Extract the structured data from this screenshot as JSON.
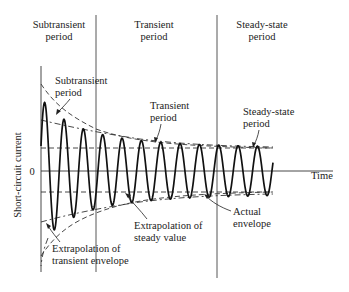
{
  "figure": {
    "type": "short-circuit current waveform diagram",
    "period_headers": [
      {
        "line1": "Subtransient",
        "line2": "period"
      },
      {
        "line1": "Transient",
        "line2": "period"
      },
      {
        "line1": "Steady-state",
        "line2": "period"
      }
    ],
    "axes": {
      "y_label": "Short-circuit current",
      "x_label": "Time",
      "origin_label": "0"
    },
    "annotations": [
      {
        "id": "subtransient",
        "line1": "Subtransient",
        "line2": "period"
      },
      {
        "id": "transient",
        "line1": "Transient",
        "line2": "period"
      },
      {
        "id": "steady-state",
        "line1": "Steady-state",
        "line2": "period"
      },
      {
        "id": "actual-envelope",
        "line1": "Actual",
        "line2": "envelope"
      },
      {
        "id": "extrap-steady",
        "line1": "Extrapolation of",
        "line2": "steady value"
      },
      {
        "id": "extrap-transient",
        "line1": "Extrapolation of",
        "line2": "transient envelope"
      }
    ],
    "colors": {
      "background": "#ffffff",
      "ink": "#111111"
    }
  }
}
